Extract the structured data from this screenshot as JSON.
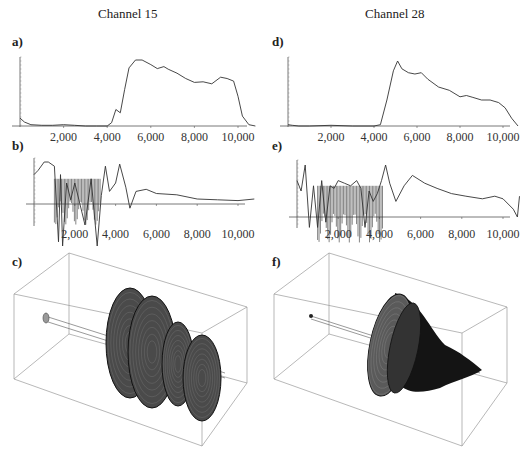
{
  "titles": {
    "left": "Channel 15",
    "right": "Channel 28"
  },
  "panel_labels": {
    "a": "a)",
    "b": "b)",
    "c": "c)",
    "d": "d)",
    "e": "e)",
    "f": "f)"
  },
  "x_ticks": [
    "2,000",
    "4,000",
    "6,000",
    "8,000",
    "10,000"
  ],
  "chart_data": [
    {
      "id": "a",
      "type": "line",
      "title": "Channel 15",
      "xlabel": "",
      "ylabel": "",
      "xlim": [
        0,
        11000
      ],
      "grid": false,
      "x": [
        0,
        200,
        500,
        1000,
        1500,
        2000,
        2500,
        3000,
        3500,
        4000,
        4200,
        4400,
        4600,
        4800,
        5000,
        5300,
        5600,
        6000,
        6300,
        6600,
        6800,
        7200,
        7600,
        8000,
        8400,
        8800,
        9200,
        9500,
        9800,
        10000,
        10200,
        10500,
        10800
      ],
      "values": [
        0.12,
        0.06,
        0.02,
        0.01,
        0.01,
        0.02,
        0.01,
        0.0,
        0.0,
        0.0,
        0.05,
        0.25,
        0.2,
        0.55,
        0.88,
        1.0,
        1.0,
        0.93,
        0.87,
        0.9,
        0.86,
        0.8,
        0.72,
        0.66,
        0.67,
        0.64,
        0.74,
        0.72,
        0.68,
        0.45,
        0.15,
        0.02,
        0.0
      ]
    },
    {
      "id": "b",
      "type": "line",
      "title": "Channel 15",
      "xlabel": "",
      "ylabel": "",
      "xlim": [
        0,
        11000
      ],
      "grid": false,
      "x": [
        0,
        200,
        500,
        700,
        1000,
        1200,
        1300,
        1400,
        1600,
        1800,
        2000,
        2200,
        2500,
        2800,
        3100,
        3300,
        3500,
        3700,
        4000,
        4200,
        4500,
        4700,
        5000,
        5500,
        6000,
        7000,
        8000,
        9000,
        10000,
        10800
      ],
      "values": [
        0.7,
        0.8,
        1.0,
        1.0,
        0.9,
        -0.9,
        0.7,
        -1.0,
        0.5,
        0.1,
        0.5,
        0.1,
        -0.5,
        0.6,
        -1.0,
        0.2,
        0.9,
        0.3,
        0.5,
        0.95,
        0.4,
        -0.1,
        0.3,
        0.35,
        0.25,
        0.22,
        0.12,
        0.1,
        0.08,
        0.12
      ]
    },
    {
      "id": "c",
      "type": "3d-surface",
      "title": "Channel 15",
      "description": "3D surface of revolution in bounding box; bulging multi-lobed shape from ~5,000 to ~10,500"
    },
    {
      "id": "d",
      "type": "line",
      "title": "Channel 28",
      "xlabel": "",
      "ylabel": "",
      "xlim": [
        0,
        11000
      ],
      "grid": false,
      "x": [
        0,
        200,
        500,
        1000,
        2000,
        3000,
        4000,
        4300,
        4600,
        4900,
        5100,
        5300,
        5600,
        5900,
        6200,
        6500,
        7000,
        7500,
        8000,
        8300,
        8600,
        9000,
        9400,
        9800,
        10100,
        10400,
        10700
      ],
      "values": [
        0.02,
        0.01,
        0.0,
        0.0,
        0.01,
        0.0,
        0.0,
        0.02,
        0.4,
        0.85,
        1.0,
        0.88,
        0.82,
        0.8,
        0.82,
        0.72,
        0.6,
        0.55,
        0.45,
        0.47,
        0.44,
        0.4,
        0.4,
        0.36,
        0.28,
        0.12,
        0.0
      ]
    },
    {
      "id": "e",
      "type": "line",
      "title": "Channel 28",
      "xlabel": "",
      "ylabel": "",
      "xlim": [
        0,
        11000
      ],
      "grid": false,
      "x": [
        0,
        200,
        400,
        600,
        800,
        1000,
        1200,
        1400,
        1600,
        1800,
        2000,
        2300,
        2600,
        2900,
        3100,
        3300,
        3500,
        3700,
        3900,
        4100,
        4300,
        4500,
        4800,
        5200,
        5600,
        6200,
        6800,
        7500,
        8200,
        9000,
        9600,
        10000,
        10500,
        10700,
        10800
      ],
      "values": [
        0.7,
        0.5,
        1.0,
        -0.2,
        0.6,
        -0.2,
        0.7,
        -0.1,
        0.6,
        0.55,
        0.7,
        0.65,
        0.6,
        0.7,
        0.55,
        -0.2,
        0.5,
        0.3,
        0.45,
        0.7,
        1.0,
        0.65,
        0.3,
        0.6,
        0.8,
        0.65,
        0.55,
        0.45,
        0.4,
        0.35,
        0.4,
        0.35,
        0.15,
        0.0,
        0.4
      ]
    },
    {
      "id": "f",
      "type": "3d-surface",
      "title": "Channel 28",
      "description": "3D surface of revolution in bounding box; large disc near ~5,000 tapering to cone toward ~10,500"
    }
  ]
}
